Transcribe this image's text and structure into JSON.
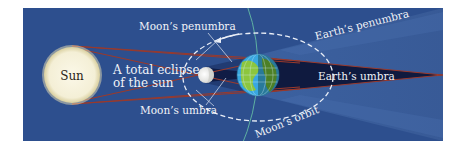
{
  "diagram": {
    "title": "A total eclipse of the sun",
    "colors": {
      "background": "#2d4f8e",
      "penumbra": "#3c5f9a",
      "earth_umbra": "#0f1a3f",
      "moon_umbra": "#1b2c5c",
      "ray_line": "#9a3a2c",
      "sun": "#f6f1da",
      "sun_glow": "#e9dfb3",
      "moon": "#f2f2f0",
      "earth_ocean": "#39a7e0",
      "earth_land": "#8cc63f",
      "orbit": "#e9eef7",
      "axis_line": "#66c2a5",
      "pointer_line": "#c9d3e6",
      "label": "#f1f3f8"
    },
    "bodies": {
      "sun": {
        "label": "Sun"
      },
      "moon": {
        "label": ""
      },
      "earth": {
        "label": ""
      }
    },
    "labels": {
      "eclipse_line1": "A total eclipse",
      "eclipse_line2": "of the sun",
      "moon_penumbra": "Moon’s penumbra",
      "moon_umbra": "Moon’s umbra",
      "moon_orbit": "Moon’s  orbit",
      "earth_penumbra": "Earth’s penumbra",
      "earth_umbra": "Earth’s umbra"
    }
  }
}
